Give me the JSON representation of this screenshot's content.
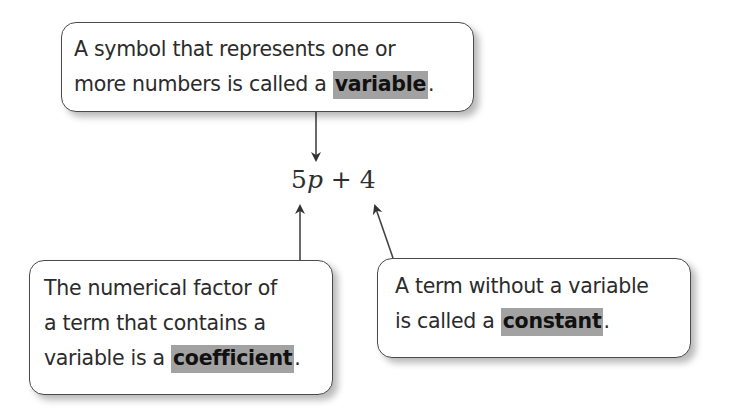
{
  "callouts": {
    "variable": {
      "lines": [
        "A symbol that represents one or",
        "more numbers is called a "
      ],
      "term": "variable",
      "end": "."
    },
    "coefficient": {
      "lines": [
        "The numerical factor of",
        "a term that contains a",
        "variable is a "
      ],
      "term": "coefficient",
      "end": "."
    },
    "constant": {
      "lines": [
        "A term without a variable",
        "is called a "
      ],
      "term": "constant",
      "end": "."
    }
  },
  "expression": {
    "coefficient": "5",
    "variable": "p",
    "operator": " + ",
    "constant": "4"
  },
  "colors": {
    "highlight": "#a2a2a2",
    "border": "#4a4a4a",
    "text": "#2b2b2b"
  }
}
